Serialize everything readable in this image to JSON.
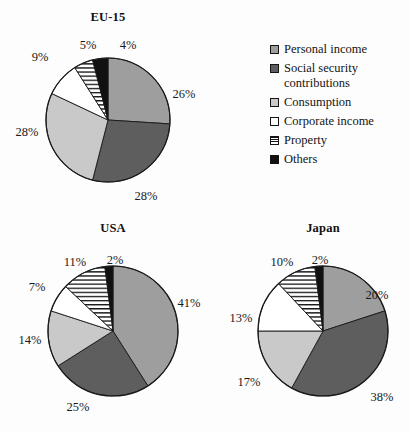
{
  "background_color": "#fdfdfd",
  "legend": {
    "name": "tax-category-legend",
    "items": [
      {
        "label": "Personal income",
        "key": "personal",
        "swatch": "solid-medium-gray",
        "color": "#9e9e9e"
      },
      {
        "label": "Social security\ncontributions",
        "label_line1": "Social security",
        "label_line2": "contributions",
        "key": "social",
        "swatch": "solid-dark-gray",
        "color": "#5e5e5e"
      },
      {
        "label": "Consumption",
        "key": "consumption",
        "swatch": "solid-light-gray",
        "color": "#c9c9c9"
      },
      {
        "label": "Corporate income",
        "key": "corporate",
        "swatch": "white-empty",
        "color": "#ffffff"
      },
      {
        "label": "Property",
        "key": "property",
        "swatch": "horizontal-stripes",
        "color": "#ffffff"
      },
      {
        "label": "Others",
        "key": "others",
        "swatch": "solid-black",
        "color": "#111111"
      }
    ]
  },
  "chart_data": [
    {
      "type": "pie",
      "title": "EU-15",
      "categories": [
        "Personal income",
        "Social security contributions",
        "Consumption",
        "Corporate income",
        "Property",
        "Others"
      ],
      "values": [
        26,
        28,
        28,
        9,
        5,
        4
      ],
      "labels": [
        "26%",
        "28%",
        "28%",
        "9%",
        "5%",
        "4%"
      ],
      "unit": "%",
      "legend_position": "right",
      "start_angle_deg": 0,
      "direction": "clockwise"
    },
    {
      "type": "pie",
      "title": "USA",
      "categories": [
        "Personal income",
        "Social security contributions",
        "Consumption",
        "Corporate income",
        "Property",
        "Others"
      ],
      "values": [
        41,
        25,
        14,
        7,
        11,
        2
      ],
      "labels": [
        "41%",
        "25%",
        "14%",
        "7%",
        "11%",
        "2%"
      ],
      "unit": "%",
      "legend_position": "shared-right",
      "start_angle_deg": 0,
      "direction": "clockwise"
    },
    {
      "type": "pie",
      "title": "Japan",
      "categories": [
        "Personal income",
        "Social security contributions",
        "Consumption",
        "Corporate income",
        "Property",
        "Others"
      ],
      "values": [
        20,
        38,
        17,
        13,
        10,
        2
      ],
      "labels": [
        "20%",
        "38%",
        "17%",
        "13%",
        "10%",
        "2%"
      ],
      "unit": "%",
      "legend_position": "shared-right",
      "start_angle_deg": 0,
      "direction": "clockwise"
    }
  ],
  "charts_layout": [
    {
      "id": "eu15",
      "cx": 108,
      "cy": 120,
      "r": 62,
      "title_x": 108,
      "title_y": 10
    },
    {
      "id": "usa",
      "cx": 113,
      "cy": 331,
      "r": 65,
      "title_x": 113,
      "title_y": 221
    },
    {
      "id": "japan",
      "cx": 323,
      "cy": 331,
      "r": 65,
      "title_x": 323,
      "title_y": 221
    }
  ],
  "label_positions": {
    "eu15": [
      {
        "t": "26%",
        "x": 184,
        "y": 94
      },
      {
        "t": "28%",
        "x": 146,
        "y": 196
      },
      {
        "t": "28%",
        "x": 27,
        "y": 132
      },
      {
        "t": "9%",
        "x": 40,
        "y": 57
      },
      {
        "t": "5%",
        "x": 88,
        "y": 45
      },
      {
        "t": "4%",
        "x": 128,
        "y": 45
      }
    ],
    "usa": [
      {
        "t": "41%",
        "x": 189,
        "y": 303
      },
      {
        "t": "25%",
        "x": 78,
        "y": 407
      },
      {
        "t": "14%",
        "x": 30,
        "y": 340
      },
      {
        "t": "7%",
        "x": 37,
        "y": 287
      },
      {
        "t": "11%",
        "x": 75,
        "y": 262
      },
      {
        "t": "2%",
        "x": 115,
        "y": 260
      }
    ],
    "japan": [
      {
        "t": "20%",
        "x": 377,
        "y": 295
      },
      {
        "t": "38%",
        "x": 382,
        "y": 397
      },
      {
        "t": "17%",
        "x": 249,
        "y": 382
      },
      {
        "t": "13%",
        "x": 241,
        "y": 318
      },
      {
        "t": "10%",
        "x": 282,
        "y": 262
      },
      {
        "t": "2%",
        "x": 320,
        "y": 260
      }
    ]
  }
}
